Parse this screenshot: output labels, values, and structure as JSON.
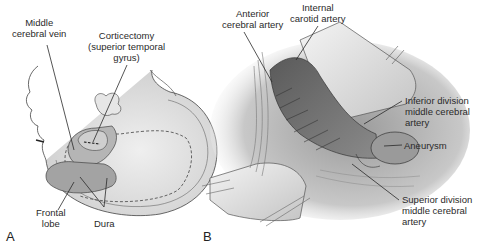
{
  "figure": {
    "panels": [
      {
        "id": "A",
        "letter": "A",
        "labels": {
          "middle_cerebral_vein": [
            "Middle",
            "cerebral vein"
          ],
          "corticectomy": [
            "Corticectomy",
            "(superior temporal",
            "gyrus)"
          ],
          "frontal_lobe": [
            "Frontal",
            "lobe"
          ],
          "dura": "Dura"
        }
      },
      {
        "id": "B",
        "letter": "B",
        "labels": {
          "anterior_cerebral_artery": [
            "Anterior",
            "cerebral artery"
          ],
          "internal_carotid_artery": [
            "Internal",
            "carotid artery"
          ],
          "inferior_division_mca": [
            "Inferior division",
            "middle cerebral",
            "artery"
          ],
          "aneurysm": "Aneurysm",
          "superior_division_mca": [
            "Superior division",
            "middle cerebral",
            "artery"
          ]
        }
      }
    ],
    "colors": {
      "line": "#2a2a2a",
      "tissue_dark": "#6e6e6e",
      "tissue_mid": "#a8a8a8",
      "tissue_light": "#d9d9d9",
      "background": "#ffffff"
    }
  }
}
